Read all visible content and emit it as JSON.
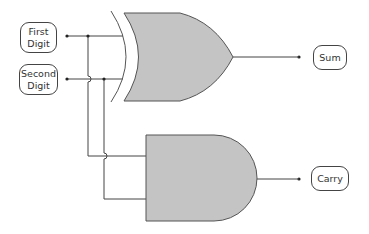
{
  "diagram": {
    "inputs": [
      {
        "id": "first",
        "lines": [
          "First",
          "Digit"
        ]
      },
      {
        "id": "second",
        "lines": [
          "Second",
          "Digit"
        ]
      }
    ],
    "outputs": [
      {
        "id": "sum",
        "label": "Sum"
      },
      {
        "id": "carry",
        "label": "Carry"
      }
    ],
    "gates": [
      {
        "type": "XOR",
        "output": "sum"
      },
      {
        "type": "AND",
        "output": "carry"
      }
    ],
    "colors": {
      "gate_fill": "#c4c4c4",
      "gate_stroke": "#555555",
      "wire": "#444444",
      "box_stroke": "#444444"
    }
  }
}
